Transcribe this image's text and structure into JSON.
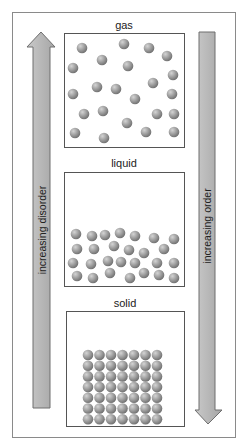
{
  "diagram": {
    "frame": {
      "x": 12,
      "y": 12,
      "w": 223,
      "h": 425,
      "stroke": "#8a8a8a"
    },
    "colors": {
      "arrow_fill_light": "#c9c9c9",
      "arrow_fill_dark": "#a6a6a6",
      "arrow_stroke": "#6e6e6e",
      "box_stroke": "#555555",
      "particle_light": "#d4d4d4",
      "particle_mid": "#9a9a9a",
      "particle_dark": "#6a6a6a"
    },
    "arrows": {
      "left": {
        "label": "increasing disorder",
        "direction": "up",
        "shaft": {
          "x": 33,
          "y": 47,
          "w": 17,
          "h": 361
        },
        "head": {
          "tip_x": 41,
          "tip_y": 32,
          "left_x": 27,
          "right_x": 55,
          "base_y": 47
        }
      },
      "right": {
        "label": "increasing order",
        "direction": "down",
        "shaft": {
          "x": 199,
          "y": 32,
          "w": 16,
          "h": 378
        },
        "head": {
          "tip_x": 208,
          "tip_y": 424,
          "left_x": 195,
          "right_x": 222,
          "base_y": 410
        }
      }
    },
    "states": [
      {
        "name": "gas",
        "label": "gas",
        "label_y": 19,
        "box": {
          "x": 64,
          "y": 33,
          "w": 120,
          "h": 114
        },
        "particles": [
          [
            82,
            48
          ],
          [
            124,
            44
          ],
          [
            149,
            48
          ],
          [
            167,
            56
          ],
          [
            102,
            60
          ],
          [
            128,
            66
          ],
          [
            73,
            68
          ],
          [
            173,
            75
          ],
          [
            153,
            83
          ],
          [
            97,
            87
          ],
          [
            116,
            89
          ],
          [
            73,
            94
          ],
          [
            172,
            94
          ],
          [
            135,
            99
          ],
          [
            84,
            114
          ],
          [
            103,
            111
          ],
          [
            157,
            114
          ],
          [
            174,
            114
          ],
          [
            127,
            123
          ],
          [
            75,
            133
          ],
          [
            104,
            138
          ],
          [
            146,
            132
          ],
          [
            174,
            132
          ]
        ]
      },
      {
        "name": "liquid",
        "label": "liquid",
        "label_y": 157,
        "box": {
          "x": 64,
          "y": 172,
          "w": 120,
          "h": 114
        },
        "particles": [
          [
            76,
            234
          ],
          [
            92,
            236
          ],
          [
            105,
            235
          ],
          [
            120,
            233
          ],
          [
            135,
            236
          ],
          [
            154,
            238
          ],
          [
            174,
            239
          ],
          [
            77,
            249
          ],
          [
            94,
            249
          ],
          [
            114,
            246
          ],
          [
            129,
            250
          ],
          [
            144,
            253
          ],
          [
            164,
            249
          ],
          [
            73,
            263
          ],
          [
            91,
            264
          ],
          [
            108,
            261
          ],
          [
            121,
            262
          ],
          [
            135,
            263
          ],
          [
            157,
            263
          ],
          [
            174,
            263
          ],
          [
            77,
            276
          ],
          [
            93,
            278
          ],
          [
            110,
            273
          ],
          [
            130,
            278
          ],
          [
            144,
            273
          ],
          [
            159,
            275
          ],
          [
            174,
            278
          ]
        ]
      },
      {
        "name": "solid",
        "label": "solid",
        "label_y": 297,
        "box": {
          "x": 66,
          "y": 311,
          "w": 118,
          "h": 115
        },
        "grid": {
          "cols": 7,
          "rows": 7,
          "start_x": 88,
          "start_y": 355,
          "dx": 11.5,
          "dy": 10.7
        }
      }
    ],
    "particle_radius": 5.3
  }
}
